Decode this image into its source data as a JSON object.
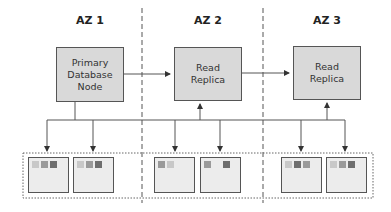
{
  "zones": [
    {
      "label": "AZ 1"
    },
    {
      "label": "AZ 2"
    },
    {
      "label": "AZ 3"
    }
  ],
  "nodes": {
    "primary": {
      "label": "Primary Database Node",
      "lines": [
        "Primary",
        "Database",
        "Node"
      ]
    },
    "replica1": {
      "label": "Read Replica",
      "lines": [
        "Read",
        "Replica"
      ]
    },
    "replica2": {
      "label": "Read Replica",
      "lines": [
        "Read",
        "Replica"
      ]
    }
  },
  "colors": {
    "node_fill": "#d9d9d9",
    "instance_fill": "#ececec",
    "square_light": "#c8c8c8",
    "square_mid": "#9a9a9a",
    "square_dark": "#6e6e6e",
    "line": "#555555"
  },
  "instances": [
    {
      "zone": "AZ 1",
      "squares": [
        "light",
        "mid",
        "dark"
      ]
    },
    {
      "zone": "AZ 1",
      "squares": [
        "light",
        "mid",
        "dark"
      ]
    },
    {
      "zone": "AZ 2",
      "squares": [
        "mid",
        "light",
        null
      ]
    },
    {
      "zone": "AZ 2",
      "squares": [
        "mid",
        null,
        "dark"
      ]
    },
    {
      "zone": "AZ 3",
      "squares": [
        "light",
        "dark",
        "mid"
      ]
    },
    {
      "zone": "AZ 3",
      "squares": [
        "light",
        "mid",
        "dark"
      ]
    }
  ]
}
